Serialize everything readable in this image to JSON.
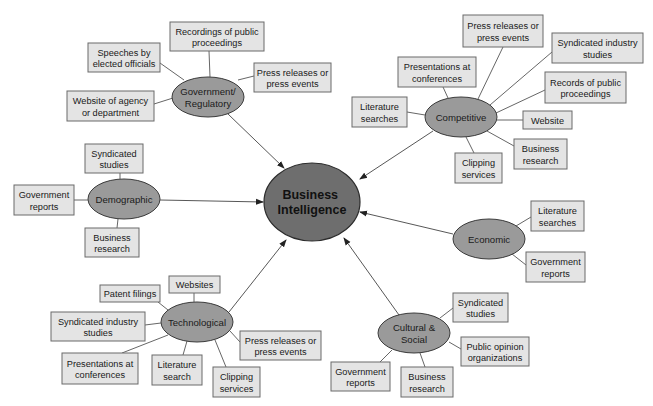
{
  "colors": {
    "leaf_fill": "#e4e4e4",
    "leaf_stroke": "#6a6a6a",
    "hub_fill": "#9a9a9a",
    "center_fill": "#6e6e6e",
    "line": "#555555",
    "background": "#ffffff"
  },
  "center": {
    "label_lines": [
      "Business",
      "Intelligence"
    ],
    "cx": 312,
    "cy": 202,
    "rx": 48,
    "ry": 39
  },
  "hubs": [
    {
      "id": "government-regulatory",
      "label_lines": [
        "Government/",
        "Regulatory"
      ],
      "cx": 208,
      "cy": 97,
      "rx": 36,
      "ry": 20,
      "arrow_from": [
        228,
        114
      ],
      "arrow_to": [
        284,
        168
      ],
      "leaves": [
        {
          "label_lines": [
            "Recordings of public",
            "proceedings"
          ],
          "x": 170,
          "y": 22,
          "w": 94,
          "h": 29,
          "anchor": [
            209,
            51
          ],
          "hub_anchor": [
            210,
            77
          ]
        },
        {
          "label_lines": [
            "Speeches by",
            "elected officials"
          ],
          "x": 88,
          "y": 43,
          "w": 72,
          "h": 29,
          "anchor": [
            160,
            63
          ],
          "hub_anchor": [
            184,
            80
          ]
        },
        {
          "label_lines": [
            "Press releases or",
            "press events"
          ],
          "x": 254,
          "y": 63,
          "w": 77,
          "h": 29,
          "anchor": [
            254,
            76
          ],
          "hub_anchor": [
            238,
            80
          ]
        },
        {
          "label_lines": [
            "Website of agency",
            "or department"
          ],
          "x": 67,
          "y": 91,
          "w": 87,
          "h": 30,
          "anchor": [
            154,
            104
          ],
          "hub_anchor": [
            173,
            98
          ]
        }
      ]
    },
    {
      "id": "competitive",
      "label_lines": [
        "Competitive"
      ],
      "cx": 461,
      "cy": 117,
      "rx": 36,
      "ry": 20,
      "arrow_from": [
        433,
        131
      ],
      "arrow_to": [
        360,
        179
      ],
      "leaves": [
        {
          "label_lines": [
            "Press releases or",
            "press events"
          ],
          "x": 463,
          "y": 15,
          "w": 80,
          "h": 32,
          "anchor": [
            503,
            47
          ],
          "hub_anchor": [
            478,
            99
          ]
        },
        {
          "label_lines": [
            "Presentations at",
            "conferences"
          ],
          "x": 398,
          "y": 57,
          "w": 78,
          "h": 30,
          "anchor": [
            443,
            87
          ],
          "hub_anchor": [
            448,
            98
          ]
        },
        {
          "label_lines": [
            "Syndicated industry",
            "studies"
          ],
          "x": 552,
          "y": 33,
          "w": 91,
          "h": 30,
          "anchor": [
            552,
            52
          ],
          "hub_anchor": [
            490,
            105
          ]
        },
        {
          "label_lines": [
            "Records of public",
            "proceedings"
          ],
          "x": 545,
          "y": 72,
          "w": 81,
          "h": 31,
          "anchor": [
            545,
            90
          ],
          "hub_anchor": [
            496,
            113
          ]
        },
        {
          "label_lines": [
            "Literature",
            "searches"
          ],
          "x": 352,
          "y": 97,
          "w": 55,
          "h": 30,
          "anchor": [
            407,
            112
          ],
          "hub_anchor": [
            425,
            115
          ]
        },
        {
          "label_lines": [
            "Website"
          ],
          "x": 523,
          "y": 111,
          "w": 49,
          "h": 18,
          "anchor": [
            523,
            120
          ],
          "hub_anchor": [
            497,
            120
          ]
        },
        {
          "label_lines": [
            "Business",
            "research"
          ],
          "x": 514,
          "y": 139,
          "w": 53,
          "h": 30,
          "anchor": [
            514,
            146
          ],
          "hub_anchor": [
            487,
            131
          ]
        },
        {
          "label_lines": [
            "Clipping",
            "services"
          ],
          "x": 455,
          "y": 153,
          "w": 47,
          "h": 30,
          "anchor": [
            474,
            153
          ],
          "hub_anchor": [
            466,
            137
          ]
        }
      ]
    },
    {
      "id": "demographic",
      "label_lines": [
        "Demographic"
      ],
      "cx": 124,
      "cy": 199,
      "rx": 36,
      "ry": 20,
      "arrow_from": [
        160,
        200
      ],
      "arrow_to": [
        263,
        202
      ],
      "leaves": [
        {
          "label_lines": [
            "Syndicated",
            "studies"
          ],
          "x": 85,
          "y": 144,
          "w": 58,
          "h": 29,
          "anchor": [
            120,
            173
          ],
          "hub_anchor": [
            120,
            179
          ]
        },
        {
          "label_lines": [
            "Government",
            "reports"
          ],
          "x": 14,
          "y": 185,
          "w": 60,
          "h": 30,
          "anchor": [
            74,
            200
          ],
          "hub_anchor": [
            88,
            200
          ]
        },
        {
          "label_lines": [
            "Business",
            "research"
          ],
          "x": 85,
          "y": 228,
          "w": 54,
          "h": 29,
          "anchor": [
            117,
            228
          ],
          "hub_anchor": [
            118,
            219
          ]
        }
      ]
    },
    {
      "id": "economic",
      "label_lines": [
        "Economic"
      ],
      "cx": 489,
      "cy": 239,
      "rx": 36,
      "ry": 20,
      "arrow_from": [
        453,
        234
      ],
      "arrow_to": [
        360,
        212
      ],
      "leaves": [
        {
          "label_lines": [
            "Literature",
            "searches"
          ],
          "x": 531,
          "y": 201,
          "w": 53,
          "h": 30,
          "anchor": [
            531,
            217
          ],
          "hub_anchor": [
            516,
            226
          ]
        },
        {
          "label_lines": [
            "Government",
            "reports"
          ],
          "x": 526,
          "y": 252,
          "w": 59,
          "h": 30,
          "anchor": [
            526,
            265
          ],
          "hub_anchor": [
            512,
            254
          ]
        }
      ]
    },
    {
      "id": "technological",
      "label_lines": [
        "Technological"
      ],
      "cx": 197,
      "cy": 322,
      "rx": 36,
      "ry": 20,
      "arrow_from": [
        229,
        312
      ],
      "arrow_to": [
        286,
        240
      ],
      "leaves": [
        {
          "label_lines": [
            "Websites"
          ],
          "x": 169,
          "y": 276,
          "w": 51,
          "h": 17,
          "anchor": [
            194,
            293
          ],
          "hub_anchor": [
            194,
            302
          ]
        },
        {
          "label_lines": [
            "Patent filings"
          ],
          "x": 100,
          "y": 285,
          "w": 60,
          "h": 17,
          "anchor": [
            158,
            302
          ],
          "hub_anchor": [
            168,
            310
          ]
        },
        {
          "label_lines": [
            "Syndicated industry",
            "studies"
          ],
          "x": 51,
          "y": 312,
          "w": 94,
          "h": 29,
          "anchor": [
            145,
            325
          ],
          "hub_anchor": [
            161,
            323
          ]
        },
        {
          "label_lines": [
            "Press releases or",
            "press events"
          ],
          "x": 240,
          "y": 331,
          "w": 81,
          "h": 29,
          "anchor": [
            240,
            342
          ],
          "hub_anchor": [
            230,
            331
          ]
        },
        {
          "label_lines": [
            "Presentations at",
            "conferences"
          ],
          "x": 62,
          "y": 353,
          "w": 76,
          "h": 31,
          "anchor": [
            122,
            353
          ],
          "hub_anchor": [
            168,
            335
          ]
        },
        {
          "label_lines": [
            "Literature",
            "search"
          ],
          "x": 152,
          "y": 355,
          "w": 50,
          "h": 30,
          "anchor": [
            183,
            355
          ],
          "hub_anchor": [
            187,
            341
          ]
        },
        {
          "label_lines": [
            "Clipping",
            "services"
          ],
          "x": 213,
          "y": 367,
          "w": 47,
          "h": 30,
          "anchor": [
            226,
            367
          ],
          "hub_anchor": [
            215,
            340
          ]
        }
      ]
    },
    {
      "id": "cultural-social",
      "label_lines": [
        "Cultural &",
        "Social"
      ],
      "cx": 414,
      "cy": 333,
      "rx": 36,
      "ry": 20,
      "arrow_from": [
        399,
        315
      ],
      "arrow_to": [
        344,
        238
      ],
      "leaves": [
        {
          "label_lines": [
            "Syndicated",
            "studies"
          ],
          "x": 453,
          "y": 293,
          "w": 55,
          "h": 29,
          "anchor": [
            453,
            308
          ],
          "hub_anchor": [
            440,
            318
          ]
        },
        {
          "label_lines": [
            "Public opinion",
            "organizations"
          ],
          "x": 461,
          "y": 337,
          "w": 68,
          "h": 29,
          "anchor": [
            461,
            349
          ],
          "hub_anchor": [
            449,
            342
          ]
        },
        {
          "label_lines": [
            "Government",
            "reports"
          ],
          "x": 331,
          "y": 362,
          "w": 59,
          "h": 29,
          "anchor": [
            380,
            362
          ],
          "hub_anchor": [
            392,
            350
          ]
        },
        {
          "label_lines": [
            "Business",
            "research"
          ],
          "x": 401,
          "y": 367,
          "w": 52,
          "h": 30,
          "anchor": [
            425,
            367
          ],
          "hub_anchor": [
            420,
            353
          ]
        }
      ]
    }
  ]
}
